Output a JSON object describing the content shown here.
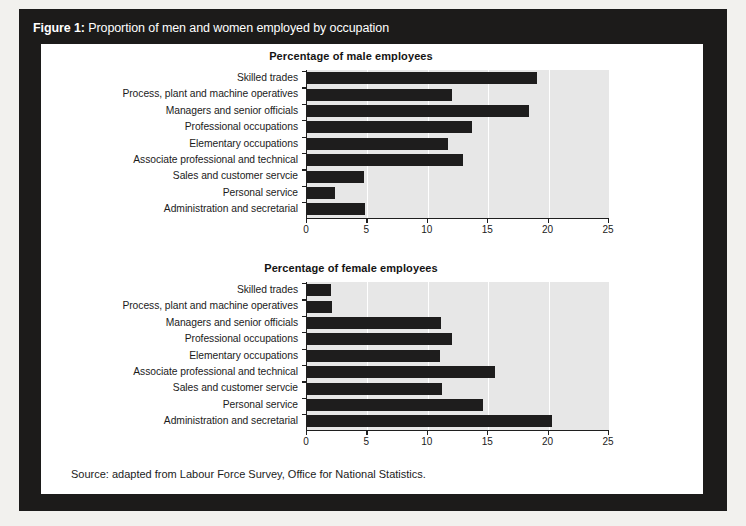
{
  "figure": {
    "label": "Figure 1:",
    "title": "Proportion of men and women employed by occupation",
    "source": "Source: adapted from Labour Force Survey, Office for National Statistics."
  },
  "colors": {
    "frame": "#1c1b1a",
    "card": "#ffffff",
    "plot_background": "#e7e7e7",
    "bar": "#1e1d1d",
    "gridline": "#ffffff",
    "axis": "#1f1f1f",
    "page_background": "#f2f1ee",
    "caption_text": "#ffffff"
  },
  "chart_data": [
    {
      "type": "bar",
      "orientation": "horizontal",
      "id": "male",
      "title": "Percentage of male employees",
      "xlabel": "",
      "ylabel": "",
      "xlim": [
        0,
        25
      ],
      "xticks": [
        0,
        5,
        10,
        15,
        20,
        25
      ],
      "xtick_labels": [
        "0",
        "5",
        "10",
        "15",
        "20",
        "25"
      ],
      "grid": true,
      "legend": "none",
      "categories": [
        "Skilled trades",
        "Process, plant and machine operatives",
        "Managers and senior officials",
        "Professional occupations",
        "Elementary occupations",
        "Associate professional and technical",
        "Sales and customer servcie",
        "Personal service",
        "Administration and secretarial"
      ],
      "values": [
        19.0,
        12.0,
        18.4,
        13.7,
        11.7,
        12.9,
        4.7,
        2.3,
        4.8
      ]
    },
    {
      "type": "bar",
      "orientation": "horizontal",
      "id": "female",
      "title": "Percentage of female employees",
      "xlabel": "",
      "ylabel": "",
      "xlim": [
        0,
        25
      ],
      "xticks": [
        0,
        5,
        10,
        15,
        20,
        25
      ],
      "xtick_labels": [
        "0",
        "5",
        "10",
        "15",
        "20",
        "25"
      ],
      "grid": true,
      "legend": "none",
      "categories": [
        "Skilled trades",
        "Process, plant and machine operatives",
        "Managers and senior officials",
        "Professional occupations",
        "Elementary occupations",
        "Associate professional and technical",
        "Sales and customer servcie",
        "Personal service",
        "Administration and secretarial"
      ],
      "values": [
        2.0,
        2.1,
        11.1,
        12.0,
        11.0,
        15.6,
        11.2,
        14.6,
        20.3
      ]
    }
  ]
}
